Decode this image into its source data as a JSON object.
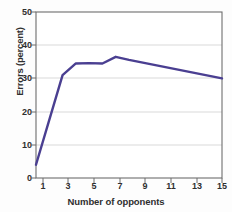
{
  "chart_data": {
    "type": "line",
    "title": "",
    "xlabel": "Number of opponents",
    "ylabel": "Errors (percent)",
    "xlim": [
      1,
      15
    ],
    "ylim": [
      0,
      50
    ],
    "xticks": [
      1,
      3,
      5,
      7,
      9,
      11,
      13,
      15
    ],
    "xticklabels": [
      "1",
      "3",
      "5",
      "7",
      "9",
      "11",
      "13",
      "15"
    ],
    "yticks": [
      0,
      10,
      20,
      30,
      40,
      50
    ],
    "yticklabels": [
      "0",
      "10",
      "20",
      "30",
      "40",
      "50"
    ],
    "grid": "horizontal",
    "legend": "none",
    "x": [
      1,
      2,
      3,
      4,
      5,
      6,
      7,
      8,
      15
    ],
    "values": [
      4,
      17.5,
      31,
      34.5,
      34.6,
      34.5,
      36.5,
      35.6,
      30
    ],
    "series": [
      {
        "name": "Errors",
        "color": "#4a3f91",
        "x": [
          1,
          2,
          3,
          4,
          5,
          6,
          7,
          8,
          15
        ],
        "values": [
          4,
          17.5,
          31,
          34.5,
          34.6,
          34.5,
          36.5,
          35.6,
          30
        ]
      }
    ],
    "colors": {
      "line": "#4a3f91",
      "grid": "#d8d8d8",
      "axis": "#5a5a5a",
      "text": "#2f2f2f",
      "plot_background": "#ffffff",
      "figure_background": "#fdfdfd"
    }
  }
}
